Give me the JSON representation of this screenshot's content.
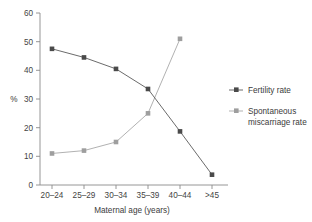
{
  "chart_data": {
    "type": "line",
    "title": "",
    "xlabel": "Maternal age (years)",
    "ylabel": "%",
    "categories": [
      "20–24",
      "25–29",
      "30–34",
      "35–39",
      "40–44",
      ">45"
    ],
    "ylim": [
      0,
      60
    ],
    "yticks": [
      0,
      10,
      20,
      30,
      40,
      50,
      60
    ],
    "ytick_labels": [
      "0",
      "10",
      "20",
      "30",
      "40",
      "50",
      "60"
    ],
    "grid": false,
    "legend_position": "right",
    "series": [
      {
        "name": "Fertility rate",
        "color": "#5a5a5a",
        "marker": "square",
        "values": [
          47.5,
          44.5,
          40.5,
          33.5,
          18.7,
          3.6
        ]
      },
      {
        "name": "Spontaneous miscarriage rate",
        "color": "#a8a8a8",
        "marker": "square",
        "values": [
          11.0,
          12.0,
          15.0,
          25.0,
          51.0,
          null
        ]
      }
    ]
  },
  "axes": {
    "y_label": "%",
    "x_label": "Maternal age (years)",
    "y_tick_0": "0",
    "y_tick_1": "10",
    "y_tick_2": "20",
    "y_tick_3": "30",
    "y_tick_4": "40",
    "y_tick_5": "50",
    "y_tick_6": "60",
    "x_tick_0": "20–24",
    "x_tick_1": "25–29",
    "x_tick_2": "30–34",
    "x_tick_3": "35–39",
    "x_tick_4": "40–44",
    "x_tick_5": ">45"
  },
  "legend": {
    "item_fertility_label": "Fertility rate",
    "item_miscarriage_line1": "Spontaneous",
    "item_miscarriage_line2": "miscarriage rate"
  },
  "colors": {
    "fertility": "#5a5a5a",
    "miscarriage": "#a8a8a8",
    "axis": "#8a8a8a",
    "text": "#3b3b3b",
    "background": "#ffffff"
  }
}
